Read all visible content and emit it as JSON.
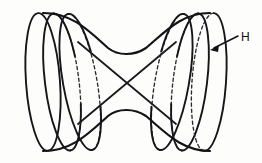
{
  "figure": {
    "name": "hyperboloid-of-one-sheet",
    "background_color": "#fdfdfc",
    "ink_color": "#16161a",
    "width": 262,
    "height": 163,
    "labels": [
      {
        "id": "H",
        "text": "H",
        "x": 243,
        "y": 41,
        "leader": {
          "from_x": 238,
          "from_y": 36,
          "to_x": 211,
          "to_y": 50
        }
      }
    ],
    "ellipses": [
      {
        "id": "ring-1",
        "cx": 43,
        "cy": 82,
        "rx": 17,
        "ry": 69,
        "rotate": -4,
        "hidden_back": false
      },
      {
        "id": "ring-2",
        "cx": 62,
        "cy": 82,
        "rx": 17,
        "ry": 69,
        "rotate": -7,
        "hidden_back": true
      },
      {
        "id": "ring-3",
        "cx": 80,
        "cy": 82,
        "rx": 17,
        "ry": 69,
        "rotate": -10,
        "hidden_back": true
      },
      {
        "id": "ring-4",
        "cx": 172,
        "cy": 82,
        "rx": 17,
        "ry": 69,
        "rotate": 10,
        "hidden_back": true
      },
      {
        "id": "ring-5",
        "cx": 190,
        "cy": 82,
        "rx": 17,
        "ry": 69,
        "rotate": 7,
        "hidden_back": true
      },
      {
        "id": "ring-6",
        "cx": 209,
        "cy": 82,
        "rx": 17,
        "ry": 69,
        "rotate": 4,
        "hidden_back": true
      }
    ],
    "silhouette": {
      "top_path": "M 43 13 C 72 13 88 30 108 48 C 118 56 134 56 146 48 C 166 31 182 13 210 13",
      "bottom_path": "M 43 151 C 72 151 88 134 108 116 C 118 108 134 108 146 116 C 166 133 182 151 210 151"
    },
    "generators": [
      {
        "id": "generator-a",
        "x1": 78,
        "y1": 42,
        "x2": 176,
        "y2": 124
      },
      {
        "id": "generator-b",
        "x1": 78,
        "y1": 124,
        "x2": 176,
        "y2": 42
      }
    ]
  }
}
